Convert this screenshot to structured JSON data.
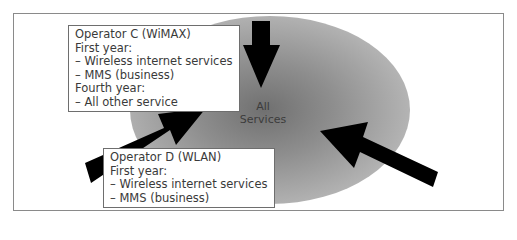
{
  "diagram": {
    "center": {
      "label_line1": "All",
      "label_line2": "Services"
    },
    "operator_c": {
      "title": "Operator C (WiMAX)",
      "lines": [
        "First year:",
        "– Wireless internet services",
        "– MMS (business)",
        "Fourth year:",
        "– All other service"
      ]
    },
    "operator_d": {
      "title": "Operator D (WLAN)",
      "lines": [
        "First year:",
        "– Wireless internet services",
        "– MMS (business)"
      ]
    },
    "arrows": [
      {
        "name": "top-arrow",
        "direction": "down"
      },
      {
        "name": "left-arrow",
        "direction": "up-right"
      },
      {
        "name": "right-arrow",
        "direction": "up-left"
      }
    ],
    "colors": {
      "ellipse_center": "#6e6e6e",
      "ellipse_edge": "#b4b4b4",
      "arrow": "#000000",
      "frame_border": "#8a8a8a"
    }
  }
}
